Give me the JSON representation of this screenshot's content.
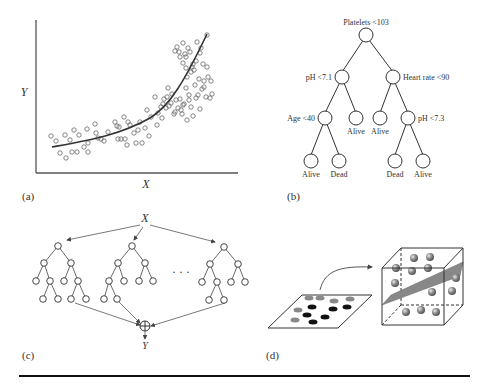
{
  "figure": {
    "panels": [
      {
        "id": "a",
        "label": "(a)",
        "type": "scatter-with-curve",
        "xlabel": "X",
        "ylabel": "Y"
      },
      {
        "id": "b",
        "label": "(b)",
        "type": "decision-tree",
        "root": "Platelets <103",
        "nodes": {
          "n_root": "Platelets <103",
          "n_l": "pH <7.1",
          "n_r": "Heart rate <90",
          "n_ll": "Age <40",
          "n_lr": "Alive",
          "n_rl": "Alive",
          "n_rr": "pH <7.3",
          "n_lll": "Alive",
          "n_llr": "Dead",
          "n_rrl": "Dead",
          "n_rrr": "Alive"
        }
      },
      {
        "id": "c",
        "label": "(c)",
        "type": "tree-ensemble",
        "input": "X",
        "output": "Y",
        "ellipsis": "· · ·",
        "combine_symbol": "⊕"
      },
      {
        "id": "d",
        "label": "(d)",
        "type": "kernel-mapping",
        "description": "2D points mapped to 3D space separated by a hyperplane"
      }
    ]
  }
}
